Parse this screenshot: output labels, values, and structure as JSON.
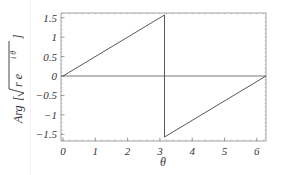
{
  "chart_data": {
    "type": "line",
    "title": "",
    "xlabel": "θ",
    "ylabel": "Arg[√(r e^{iθ})]",
    "xlim": [
      0,
      6.4
    ],
    "ylim": [
      -1.6,
      1.6
    ],
    "x_ticks": [
      "0",
      "1",
      "2",
      "3",
      "4",
      "5",
      "6"
    ],
    "y_ticks": [
      "-1.5",
      "-1",
      "-0.5",
      "0",
      "0.5",
      "1",
      "1.5"
    ],
    "grid": false,
    "legend": null,
    "series": [
      {
        "name": "Arg[Sqrt[r e^(iθ)]]",
        "points": [
          [
            0,
            0
          ],
          [
            3.14159,
            1.5708
          ],
          [
            3.14159,
            -1.5708
          ],
          [
            6.28319,
            0
          ]
        ]
      }
    ],
    "annotations": [
      "horizontal reference line at y = 0"
    ]
  },
  "labels": {
    "x_axis": "θ",
    "y_axis_prefix": "Arg",
    "y_axis_sqrt_body": "r e",
    "y_axis_exponent": "i θ"
  }
}
